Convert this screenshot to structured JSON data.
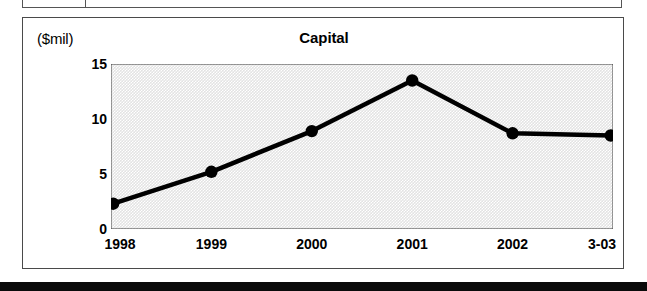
{
  "chart_data": {
    "type": "line",
    "title": "Capital",
    "ylabel": "($mil)",
    "xlabel": "",
    "categories": [
      "1998",
      "1999",
      "2000",
      "2001",
      "2002",
      "3-03"
    ],
    "values": [
      2.3,
      5.2,
      8.9,
      13.5,
      8.7,
      8.5
    ],
    "ylim": [
      0,
      15
    ],
    "yticks": [
      0,
      5,
      10,
      15
    ],
    "ytick_labels": [
      "0",
      "5",
      "10",
      "15"
    ],
    "minor_yticks": [
      2.5,
      7.5,
      12.5
    ],
    "grid": false,
    "legend": false,
    "series": [
      {
        "name": "Capital",
        "values": [
          2.3,
          5.2,
          8.9,
          13.5,
          8.7,
          8.5
        ]
      }
    ],
    "colors": {
      "line": "#000000",
      "marker": "#000000",
      "plot_background": "#e3e3e3",
      "panel_background": "#ffffff",
      "border": "#4a4a4a",
      "text": "#000000"
    },
    "marker_style": "filled-circle",
    "line_width_px": 4
  }
}
